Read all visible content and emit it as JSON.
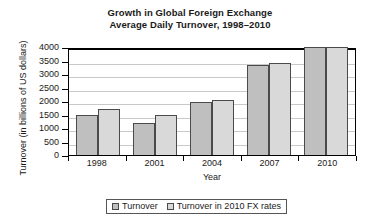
{
  "chart_data": {
    "type": "bar",
    "title": "Growth in Global Foreign Exchange Average Daily Turnover, 1998–2010",
    "title_lines": [
      "Growth in Global Foreign Exchange",
      "Average Daily Turnover, 1998–2010"
    ],
    "xlabel": "Year",
    "ylabel": "Turnover (in billions of US dollars)",
    "categories": [
      "1998",
      "2001",
      "2004",
      "2007",
      "2010"
    ],
    "series": [
      {
        "name": "Turnover",
        "color": "#bfbfbf",
        "values": [
          1500,
          1200,
          1950,
          3350,
          4000
        ]
      },
      {
        "name": "Turnover in 2010 FX rates",
        "color": "#d9d9d9",
        "values": [
          1700,
          1500,
          2050,
          3400,
          4000
        ]
      }
    ],
    "ylim": [
      0,
      4000
    ],
    "ytick_step": 500,
    "yticks": [
      "4000",
      "3500",
      "3000",
      "2500",
      "2000",
      "1500",
      "1000",
      "500",
      "0"
    ],
    "grid": true,
    "legend_position": "bottom"
  }
}
